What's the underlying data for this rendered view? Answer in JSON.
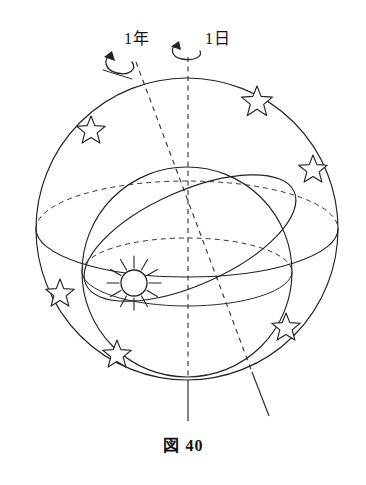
{
  "figure": {
    "caption_prefix": "図",
    "caption_number": "40",
    "labels": {
      "year": "1年",
      "day": "1日"
    },
    "colors": {
      "ink": "#232323",
      "background": "#ffffff"
    },
    "diagram": {
      "title_semantic": "celestial-sphere-with-earth-rotation-and-revolution",
      "outer_sphere": {
        "name": "celestial-sphere",
        "cx": 187,
        "cy": 229,
        "r": 151
      },
      "inner_sphere": {
        "name": "earth-orbit-sphere",
        "cx": 187,
        "cy": 272,
        "r": 105
      },
      "equator_ring": {
        "name": "celestial-equator-ring",
        "cx": 187,
        "cy": 229,
        "rx": 151,
        "ry": 48
      },
      "ecliptic_ring": {
        "name": "ecliptic-ring",
        "cx": 187,
        "cy": 235,
        "rx": 112,
        "ry": 45,
        "rotation_deg": -24
      },
      "rotation_axis": {
        "name": "rotation-axis-vertical",
        "x": 188,
        "y_top": 55,
        "y_bottom": 420,
        "style": "dashed-upper-solid-lower"
      },
      "orbital_axis": {
        "name": "orbital-axis-tilted",
        "x1": 135,
        "y1": 60,
        "x2": 268,
        "y2": 415,
        "style": "dashed-upper-solid-lower",
        "tilt_deg": 20.5
      },
      "sun": {
        "name": "sun-symbol",
        "cx": 134,
        "cy": 283,
        "r": 13,
        "ray_count": 12
      },
      "stars": [
        {
          "cx": 257,
          "cy": 99,
          "r": 13
        },
        {
          "cx": 91,
          "cy": 128,
          "r": 12
        },
        {
          "cx": 313,
          "cy": 167,
          "r": 12
        },
        {
          "cx": 60,
          "cy": 291,
          "r": 12
        },
        {
          "cx": 286,
          "cy": 325,
          "r": 12
        },
        {
          "cx": 117,
          "cy": 352,
          "r": 12
        }
      ],
      "arrows": [
        {
          "name": "revolution-arrow",
          "about": "orbital-axis",
          "direction": "counterclockwise"
        },
        {
          "name": "rotation-arrow",
          "about": "rotation-axis",
          "direction": "counterclockwise"
        }
      ]
    }
  }
}
